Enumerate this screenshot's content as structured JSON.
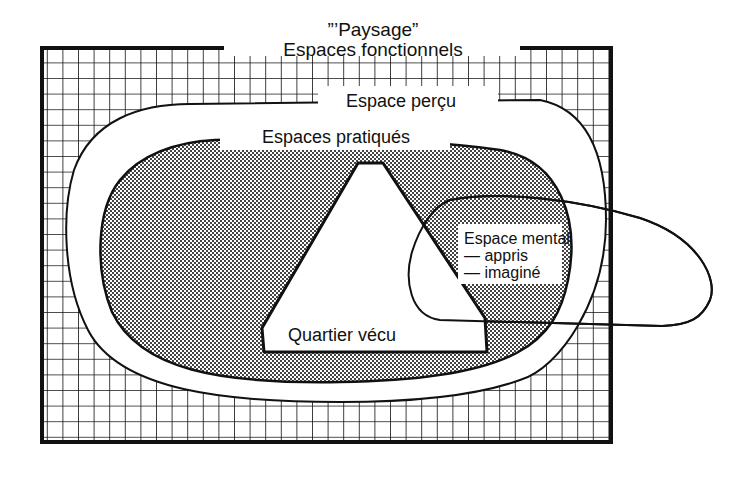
{
  "diagram": {
    "title": {
      "line1": "”’Paysage”",
      "line2": "Espaces fonctionnels"
    },
    "regions": [
      {
        "id": "paysage",
        "label": "\"Paysage\" Espaces fonctionnels",
        "fill": "grid"
      },
      {
        "id": "espace-percu",
        "label": "Espace perçu",
        "fill": "white"
      },
      {
        "id": "espaces-pratiques",
        "label": "Espaces pratiqués",
        "fill": "dotted"
      },
      {
        "id": "quartier-vecu",
        "label": "Quartier vécu",
        "fill": "white"
      },
      {
        "id": "espace-mental",
        "label": "Espace mental",
        "items": [
          "— appris",
          "— imaginé"
        ],
        "fill": "outline"
      }
    ],
    "labels": {
      "percu": "Espace perçu",
      "pratiques": "Espaces pratiqués",
      "mental_title": "Espace mental",
      "mental_item1": "— appris",
      "mental_item2": "— imaginé",
      "vecu": "Quartier vécu"
    },
    "colors": {
      "ink": "#111111",
      "paper": "#ffffff",
      "stipple": "#555555"
    }
  }
}
